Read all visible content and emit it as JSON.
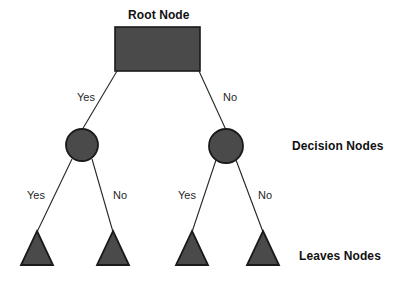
{
  "diagram": {
    "type": "decision-tree",
    "background_color": "#ffffff",
    "shape_fill_color": "#4a4a4a",
    "shape_stroke_color": "#1a1a1a",
    "edge_color": "#262626",
    "text_color": "#111111",
    "title": "Root Node",
    "nodes": {
      "root": {
        "label": "Root Node",
        "shape": "rectangle"
      },
      "decision_left": {
        "shape": "circle"
      },
      "decision_right": {
        "shape": "circle"
      },
      "leaf_1": {
        "shape": "triangle"
      },
      "leaf_2": {
        "shape": "triangle"
      },
      "leaf_3": {
        "shape": "triangle"
      },
      "leaf_4": {
        "shape": "triangle"
      }
    },
    "edges": {
      "root_left": "Yes",
      "root_right": "No",
      "left_leaf_1": "Yes",
      "left_leaf_2": "No",
      "right_leaf_3": "Yes",
      "right_leaf_4": "No"
    },
    "legend": {
      "decision_nodes": "Decision Nodes",
      "leaves_nodes": "Leaves Nodes"
    }
  }
}
